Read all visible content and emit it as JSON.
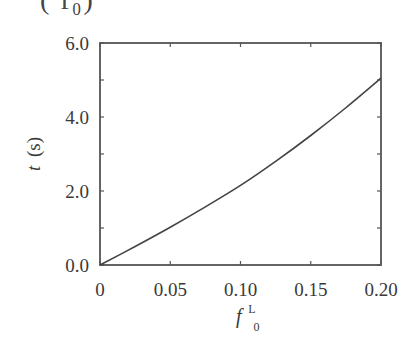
{
  "header_fragment": "(      f₀)",
  "chart_data": {
    "type": "line",
    "title": "",
    "xlabel": "f",
    "xlabel_sup": "L",
    "xlabel_sub": "0",
    "ylabel": "t (s)",
    "ylabel_italic": "t",
    "ylabel_unit": "(s)",
    "xlim": [
      0,
      0.2
    ],
    "ylim": [
      0,
      6.0
    ],
    "x_ticks": [
      0,
      0.05,
      0.1,
      0.15,
      0.2
    ],
    "x_tick_labels": [
      "0",
      "0.05",
      "0.10",
      "0.15",
      "0.20"
    ],
    "y_ticks": [
      0,
      2.0,
      4.0,
      6.0
    ],
    "y_tick_labels": [
      "0.0",
      "2.0",
      "4.0",
      "6.0"
    ],
    "y_minor_ticks": [
      1.0,
      3.0,
      5.0
    ],
    "grid": false,
    "legend": null,
    "series": [
      {
        "name": "t vs f0L",
        "x": [
          0,
          0.025,
          0.05,
          0.075,
          0.1,
          0.125,
          0.15,
          0.175,
          0.2
        ],
        "y": [
          0,
          0.5,
          1.02,
          1.57,
          2.15,
          2.8,
          3.5,
          4.25,
          5.05
        ],
        "color": "#444444"
      }
    ]
  }
}
